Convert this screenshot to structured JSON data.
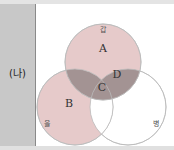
{
  "row_label": "(나)",
  "circles": {
    "top": {
      "name": "갑",
      "fill": "#e6c8c8"
    },
    "left": {
      "name": "을",
      "fill": "#e6c8c8"
    },
    "right": {
      "name": "병",
      "fill": "#ffffff"
    }
  },
  "regions": {
    "A": "A",
    "B": "B",
    "C": "C",
    "D": "D"
  },
  "colors": {
    "light_region": "#e8cccc",
    "dark_region": "#a09090",
    "outline": "#bbbbbb"
  }
}
